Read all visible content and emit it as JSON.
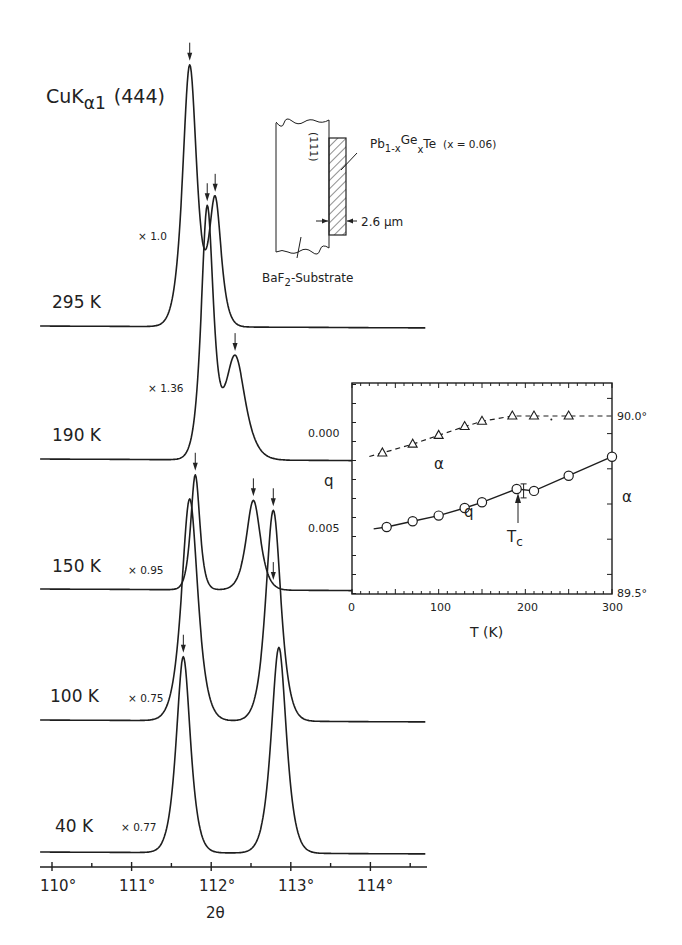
{
  "chart_data": [
    {
      "type": "line",
      "title": "CuKα1 (444)",
      "xlabel": "2θ",
      "ylabel": "",
      "x_ticks": [
        "110°",
        "111°",
        "112°",
        "113°",
        "114°"
      ],
      "xlim": [
        109.85,
        114.7
      ],
      "grid": false,
      "legend": "none",
      "description": "X-ray diffraction (444) reflection profiles of Pb1-xGexTe film at various temperatures, curves offset vertically",
      "series": [
        {
          "name": "295 K",
          "scale": "× 1.0",
          "peaks_2theta": [
            111.73,
            112.05
          ],
          "peak_heights_rel": [
            1.0,
            0.48
          ],
          "arrows_2theta": [
            111.73,
            112.05
          ]
        },
        {
          "name": "190 K",
          "scale": "× 1.36",
          "peaks_2theta": [
            111.95,
            112.3
          ],
          "peak_heights_rel": [
            1.0,
            0.42
          ],
          "arrows_2theta": [
            111.95,
            112.3
          ]
        },
        {
          "name": "150 K",
          "scale": "× 0.95",
          "peaks_2theta": [
            111.8,
            112.53
          ],
          "peak_heights_rel": [
            1.0,
            0.78
          ],
          "arrows_2theta": [
            111.8,
            112.53,
            112.78
          ]
        },
        {
          "name": "100 K",
          "scale": "× 0.75",
          "peaks_2theta": [
            111.73,
            112.78
          ],
          "peak_heights_rel": [
            1.0,
            0.95
          ],
          "arrows_2theta": [
            112.78
          ]
        },
        {
          "name": "40 K",
          "scale": "× 0.77",
          "peaks_2theta": [
            111.65,
            112.85
          ],
          "peak_heights_rel": [
            1.0,
            1.05
          ],
          "arrows_2theta": [
            111.65
          ]
        }
      ],
      "annotations": [
        "CuKα1 (444)",
        "× 1.0",
        "× 1.36",
        "× 0.95",
        "× 0.75",
        "× 0.77"
      ]
    },
    {
      "type": "scatter",
      "title": "",
      "xlabel": "T (K)",
      "ylabel": "q",
      "ylabel_right": "α",
      "xlim": [
        0,
        300
      ],
      "x_ticks": [
        "0",
        "100",
        "200",
        "300"
      ],
      "ylim_left": [
        0.0083,
        -0.0028
      ],
      "y_ticks_left": [
        "0.000",
        "0.005"
      ],
      "y_ticks_right": [
        "90.0°",
        "89.5°"
      ],
      "grid": false,
      "series": [
        {
          "name": "q",
          "marker": "circle",
          "line": "solid",
          "x": [
            40,
            70,
            100,
            130,
            150,
            190,
            210,
            250,
            300
          ],
          "y": [
            0.005,
            0.0047,
            0.0044,
            0.004,
            0.0037,
            0.003,
            0.0031,
            0.0023,
            0.0013
          ]
        },
        {
          "name": "α",
          "marker": "triangle",
          "line": "dashed",
          "x": [
            35,
            70,
            100,
            130,
            150,
            185,
            210,
            250
          ],
          "y_deg": [
            89.895,
            89.92,
            89.945,
            89.97,
            89.985,
            90.0,
            90.0,
            90.0
          ]
        }
      ],
      "annotations": [
        "Tc ↑ at ≈190 K",
        "error bar at ≈198 K",
        "α (dashed)",
        "q (solid)"
      ]
    }
  ],
  "main_plot": {
    "title": {
      "base": "CuK",
      "sub": "α1",
      "reflection": "(444)"
    },
    "xlabel": "2θ",
    "x_ticks": [
      {
        "label": "110°",
        "value": 110
      },
      {
        "label": "111°",
        "value": 111
      },
      {
        "label": "112°",
        "value": 112
      },
      {
        "label": "113°",
        "value": 113
      },
      {
        "label": "114°",
        "value": 114
      }
    ],
    "curves": [
      {
        "temp": "295 K",
        "scale": "× 1.0"
      },
      {
        "temp": "190 K",
        "scale": "× 1.36"
      },
      {
        "temp": "150 K",
        "scale": "× 0.95"
      },
      {
        "temp": "100 K",
        "scale": "× 0.75"
      },
      {
        "temp": "40 K",
        "scale": "× 0.77"
      }
    ]
  },
  "schematic": {
    "crystal_face": "(111)",
    "film_formula": {
      "a": "Pb",
      "a_sub": "1-x",
      "b": "Ge",
      "b_sub": "x",
      "c": "Te",
      "composition": "(x = 0.06)"
    },
    "thickness": "2.6 µm",
    "substrate": {
      "a": "BaF",
      "sub": "2",
      "b": "-Substrate"
    }
  },
  "inset": {
    "xlabel": "T (K)",
    "ylabel_left": "q",
    "ylabel_right": "α",
    "x_ticks": [
      "0",
      "100",
      "200",
      "300"
    ],
    "y_ticks_left": [
      "0.000",
      "0.005"
    ],
    "y_ticks_right": [
      "90.0°",
      "89.5°"
    ],
    "series_labels": {
      "alpha": "α",
      "q": "q"
    },
    "tc_label": {
      "base": "T",
      "sub": "c"
    }
  }
}
